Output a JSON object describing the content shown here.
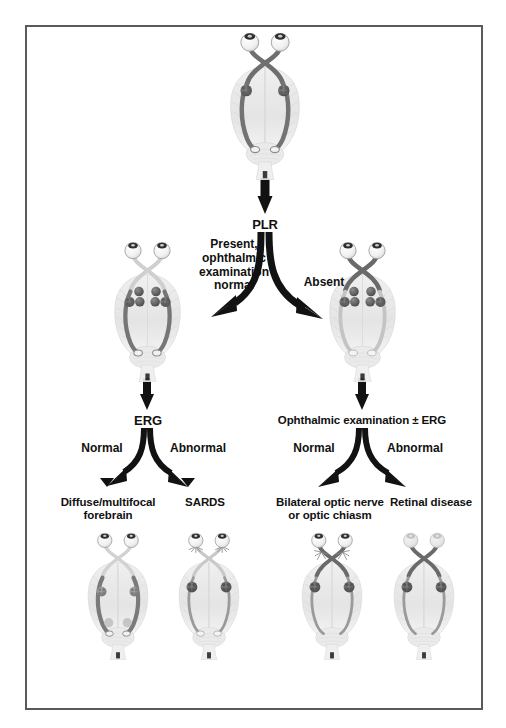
{
  "figure": {
    "background": "#ffffff",
    "frame_color": "#5a5a5a",
    "ink_color": "#111111"
  },
  "nodes": {
    "plr": "PLR",
    "erg": "ERG",
    "ophthalmic_erg": "Ophthalmic examination ± ERG",
    "diffuse_forebrain_line1": "Diffuse/multifocal",
    "diffuse_forebrain_line2": "forebrain",
    "sards": "SARDS",
    "bilateral_optic_line1": "Bilateral optic nerve",
    "bilateral_optic_line2": "or optic chiasm",
    "retinal_disease": "Retinal disease"
  },
  "edge_labels": {
    "present_line1": "Present,",
    "present_line2": "ophthalmic",
    "present_line3": "examination",
    "present_line4": "normal",
    "absent": "Absent",
    "erg_normal": "Normal",
    "erg_abnormal": "Abnormal",
    "ophth_normal": "Normal",
    "ophth_abnormal": "Abnormal"
  },
  "illustrations": {
    "top": {
      "name": "visual-pathway-normal",
      "eye_fill": "#f2f2f2",
      "nerve_shade": "dark",
      "tract_shade": "dark",
      "ganglion_shade": "dark"
    },
    "mid_left": {
      "name": "visual-pathway-plr-present",
      "eye_fill": "#f2f2f2",
      "nerve_shade": "light",
      "tract_shade": "dark",
      "ganglion_shade": "dark"
    },
    "mid_right": {
      "name": "visual-pathway-plr-absent",
      "eye_fill": "#f2f2f2",
      "nerve_shade": "dark",
      "tract_shade": "light",
      "ganglion_shade": "dark"
    },
    "bottom_1": {
      "name": "visual-pathway-diffuse-forebrain",
      "eye_fill": "#f2f2f2",
      "nerve_shade": "light",
      "tract_shade": "dark",
      "ganglion_shade": "mid"
    },
    "bottom_2": {
      "name": "visual-pathway-sards",
      "eye_fill": "#f2f2f2",
      "nerve_shade": "light",
      "tract_shade": "light",
      "ganglion_shade": "dark",
      "marker": "retina-burst"
    },
    "bottom_3": {
      "name": "visual-pathway-optic-nerve-chiasm",
      "eye_fill": "#f2f2f2",
      "nerve_shade": "dark",
      "tract_shade": "light",
      "ganglion_shade": "dark",
      "marker": "chiasm-burst"
    },
    "bottom_4": {
      "name": "visual-pathway-retinal-disease",
      "eye_fill": "#e8e8e8",
      "eye_faded": true,
      "nerve_shade": "dark",
      "tract_shade": "light",
      "ganglion_shade": "dark"
    }
  }
}
